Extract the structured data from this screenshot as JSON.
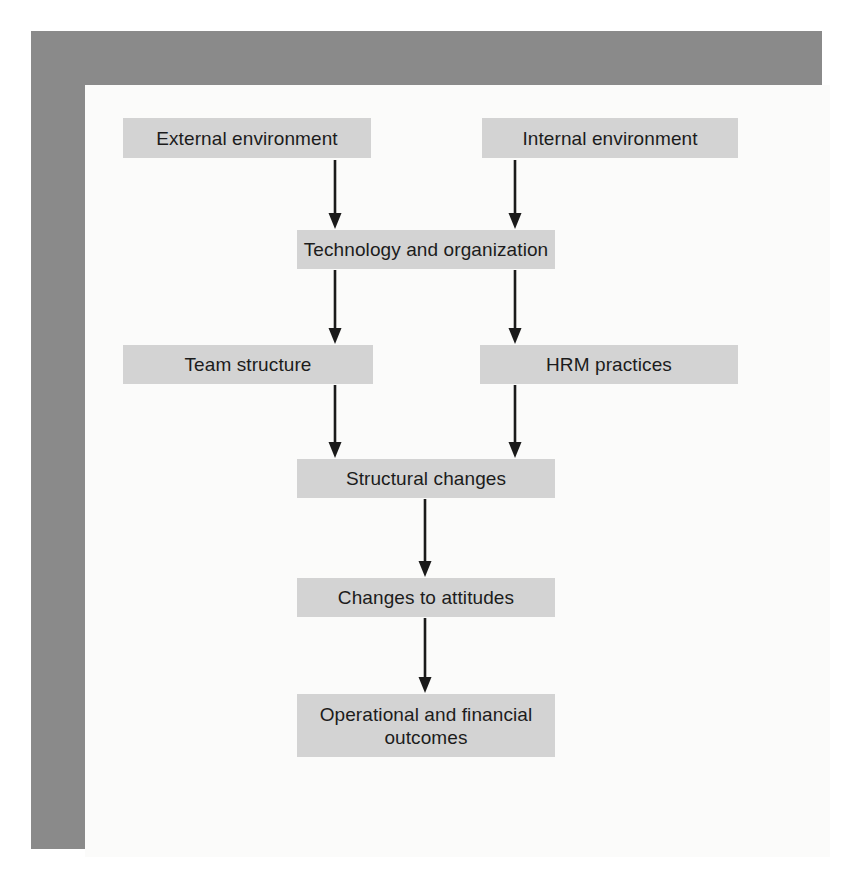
{
  "figure": {
    "type": "flowchart",
    "orientation": "top-to-bottom",
    "frame": {
      "outer_background": "#ffffff",
      "border_color": "#8a8a8a",
      "inner_background": "#fbfbfa"
    },
    "style": {
      "node_fill": "#d3d3d3",
      "node_text_color": "#1c1c1c",
      "arrow_color": "#1a1a1a"
    }
  },
  "nodes": [
    {
      "id": "external_environment",
      "label": "External environment",
      "x": 123,
      "y": 118,
      "w": 248,
      "h": 40,
      "lines": 1
    },
    {
      "id": "internal_environment",
      "label": "Internal environment",
      "x": 482,
      "y": 118,
      "w": 256,
      "h": 40,
      "lines": 1
    },
    {
      "id": "technology_org",
      "label": "Technology and organization",
      "x": 297,
      "y": 230,
      "w": 258,
      "h": 39,
      "lines": 1
    },
    {
      "id": "team_structure",
      "label": "Team structure",
      "x": 123,
      "y": 345,
      "w": 250,
      "h": 39,
      "lines": 1
    },
    {
      "id": "hrm_practices",
      "label": "HRM practices",
      "x": 480,
      "y": 345,
      "w": 258,
      "h": 39,
      "lines": 1
    },
    {
      "id": "structural_changes",
      "label": "Structural changes",
      "x": 297,
      "y": 459,
      "w": 258,
      "h": 39,
      "lines": 1
    },
    {
      "id": "changes_to_attitudes",
      "label": "Changes to attitudes",
      "x": 297,
      "y": 578,
      "w": 258,
      "h": 39,
      "lines": 1
    },
    {
      "id": "operational_outcomes",
      "label": "Operational and financial\noutcomes",
      "x": 297,
      "y": 694,
      "w": 258,
      "h": 63,
      "lines": 2
    }
  ],
  "edges": [
    {
      "id": "edge-external-to-technology",
      "from": "external_environment",
      "to": "technology_org",
      "x": 335,
      "y1": 160,
      "y2": 229
    },
    {
      "id": "edge-internal-to-technology",
      "from": "internal_environment",
      "to": "technology_org",
      "x": 515,
      "y1": 160,
      "y2": 229
    },
    {
      "id": "edge-technology-to-team",
      "from": "technology_org",
      "to": "team_structure",
      "x": 335,
      "y1": 270,
      "y2": 344
    },
    {
      "id": "edge-technology-to-hrm",
      "from": "technology_org",
      "to": "hrm_practices",
      "x": 515,
      "y1": 270,
      "y2": 344
    },
    {
      "id": "edge-team-to-structural",
      "from": "team_structure",
      "to": "structural_changes",
      "x": 335,
      "y1": 385,
      "y2": 458
    },
    {
      "id": "edge-hrm-to-structural",
      "from": "hrm_practices",
      "to": "structural_changes",
      "x": 515,
      "y1": 385,
      "y2": 458
    },
    {
      "id": "edge-structural-to-attitudes",
      "from": "structural_changes",
      "to": "changes_to_attitudes",
      "x": 425,
      "y1": 499,
      "y2": 577
    },
    {
      "id": "edge-attitudes-to-outcomes",
      "from": "changes_to_attitudes",
      "to": "operational_outcomes",
      "x": 425,
      "y1": 618,
      "y2": 693
    }
  ]
}
